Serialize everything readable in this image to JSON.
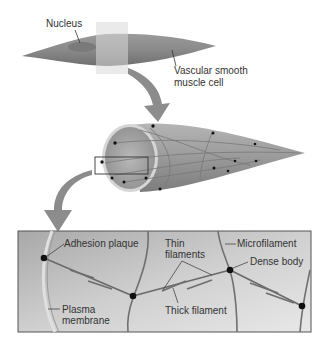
{
  "diagram": {
    "top_cell": {
      "labels": {
        "nucleus": "Nucleus",
        "cell_line1": "Vascular smooth",
        "cell_line2": "muscle cell"
      }
    },
    "detail_box": {
      "labels": {
        "adhesion_plaque": "Adhesion plaque",
        "thin_line1": "Thin",
        "thin_line2": "filaments",
        "microfilament": "Microfilament",
        "dense_body": "Dense body",
        "plasma_line1": "Plasma",
        "plasma_line2": "membrane",
        "thick_filament": "Thick filament"
      }
    },
    "colors": {
      "cell_fill": "#8a8a8a",
      "arrow": "#8c8c8c",
      "filament": "#6e6e6e",
      "dot": "#111111",
      "box_border": "#555555"
    }
  }
}
